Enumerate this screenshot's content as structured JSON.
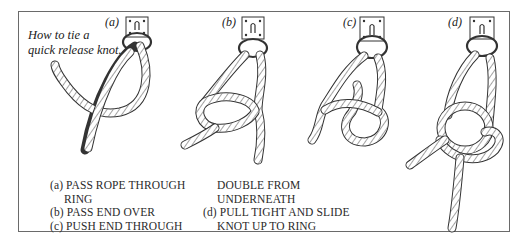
{
  "title": {
    "line1": "How to tie a",
    "line2": "quick release knot."
  },
  "figures": [
    {
      "label": "(a)",
      "caption_key": "a"
    },
    {
      "label": "(b)",
      "caption_key": "b"
    },
    {
      "label": "(c)",
      "caption_key": "c"
    },
    {
      "label": "(d)",
      "caption_key": "d"
    }
  ],
  "instructions": {
    "col1": [
      {
        "marker": "(a)",
        "text": "PASS ROPE THROUGH"
      },
      {
        "marker": "",
        "text": "RING"
      },
      {
        "marker": "(b)",
        "text": "PASS END OVER"
      },
      {
        "marker": "(c)",
        "text": "PUSH END THROUGH"
      }
    ],
    "col2": [
      {
        "marker": "",
        "text": "DOUBLE FROM"
      },
      {
        "marker": "",
        "text": "UNDERNEATH"
      },
      {
        "marker": "(d)",
        "text": "PULL TIGHT AND SLIDE"
      },
      {
        "marker": "",
        "text": "KNOT UP TO RING"
      }
    ]
  },
  "colors": {
    "ink": "#2a2a2a",
    "frame": "#6a6a6a",
    "background": "#ffffff"
  }
}
